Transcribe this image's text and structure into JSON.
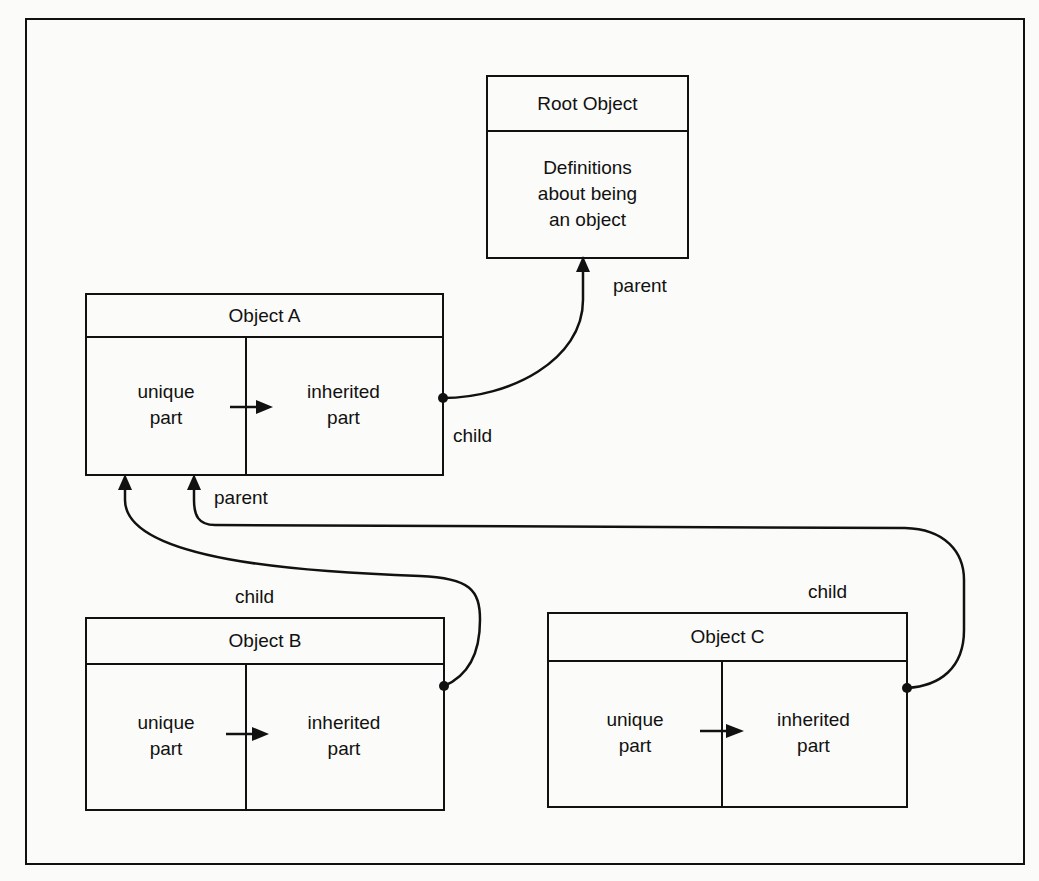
{
  "diagram": {
    "root": {
      "title": "Root Object",
      "body": "Definitions\nabout being\nan object"
    },
    "objects": [
      {
        "id": "A",
        "title": "Object A",
        "unique": "unique\npart",
        "inherited": "inherited\npart"
      },
      {
        "id": "B",
        "title": "Object B",
        "unique": "unique\npart",
        "inherited": "inherited\npart"
      },
      {
        "id": "C",
        "title": "Object C",
        "unique": "unique\npart",
        "inherited": "inherited\npart"
      }
    ],
    "labels": {
      "root_parent": "parent",
      "a_child": "child",
      "a_parent": "parent",
      "b_child": "child",
      "c_child": "child"
    },
    "edges": [
      {
        "from": "Object A",
        "to": "Root Object",
        "from_label": "child",
        "to_label": "parent"
      },
      {
        "from": "Object B",
        "to": "Object A",
        "from_label": "child",
        "to_label": ""
      },
      {
        "from": "Object C",
        "to": "Object A",
        "from_label": "child",
        "to_label": "parent"
      }
    ]
  }
}
